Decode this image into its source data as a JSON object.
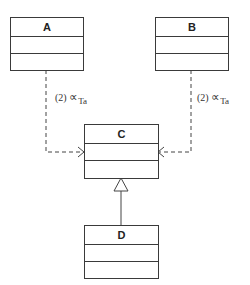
{
  "diagram": {
    "type": "UML class diagram",
    "classes": [
      {
        "id": "A",
        "name": "A"
      },
      {
        "id": "B",
        "name": "B"
      },
      {
        "id": "C",
        "name": "C"
      },
      {
        "id": "D",
        "name": "D"
      }
    ],
    "relations": [
      {
        "from": "A",
        "to": "C",
        "kind": "dependency",
        "label": {
          "index": "(2)",
          "symbol": "∝",
          "subscript": "Ta"
        }
      },
      {
        "from": "B",
        "to": "C",
        "kind": "dependency",
        "label": {
          "index": "(2)",
          "symbol": "∝",
          "subscript": "Ta"
        }
      },
      {
        "from": "D",
        "to": "C",
        "kind": "generalization"
      }
    ],
    "colors": {
      "line": "#3a3a3a",
      "background": "#ffffff"
    }
  }
}
